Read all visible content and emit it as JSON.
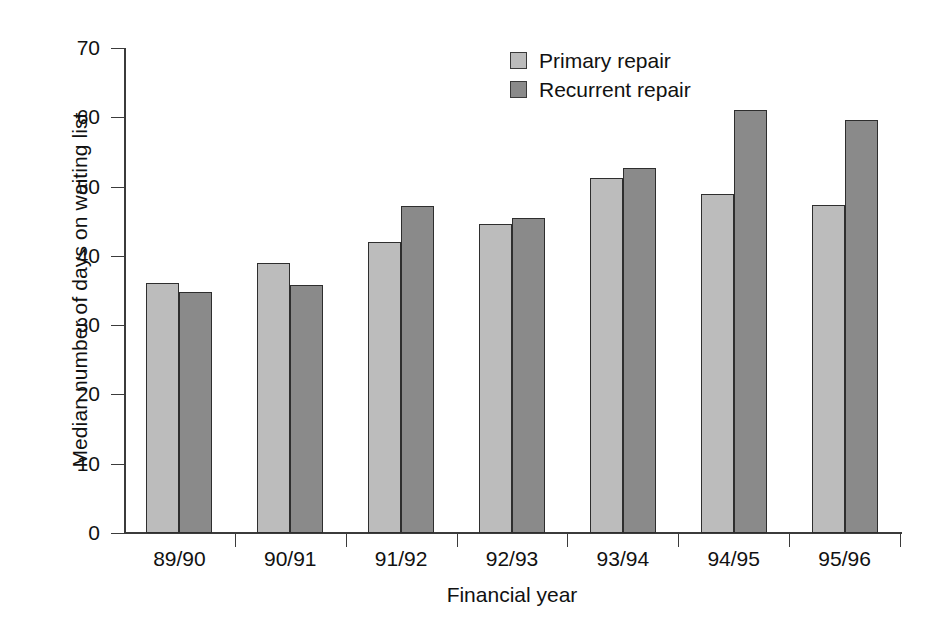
{
  "chart_data": {
    "type": "bar",
    "title": "",
    "subtitle": "",
    "xlabel": "Financial year",
    "ylabel": "Median number of days on waiting list",
    "categories": [
      "89/90",
      "90/91",
      "91/92",
      "92/93",
      "93/94",
      "94/95",
      "95/96"
    ],
    "series": [
      {
        "name": "Primary repair",
        "color": "#bcbcbc",
        "values": [
          36.1,
          39.0,
          42.0,
          44.6,
          51.2,
          48.9,
          47.3
        ]
      },
      {
        "name": "Recurrent repair",
        "color": "#8a8a8a",
        "values": [
          34.8,
          35.8,
          47.2,
          45.5,
          52.7,
          61.0,
          59.6
        ]
      }
    ],
    "ylim": [
      0,
      70
    ],
    "ytick_labels": [
      "0",
      "10",
      "20",
      "30",
      "40",
      "50",
      "60",
      "70"
    ],
    "ytick_values": [
      0,
      10,
      20,
      30,
      40,
      50,
      60,
      70
    ],
    "grid": false,
    "legend_position": "top-center"
  },
  "legend": {
    "items": [
      {
        "label": "Primary repair",
        "swatch": "primary-repair-swatch"
      },
      {
        "label": "Recurrent repair",
        "swatch": "recurrent-repair-swatch"
      }
    ]
  }
}
